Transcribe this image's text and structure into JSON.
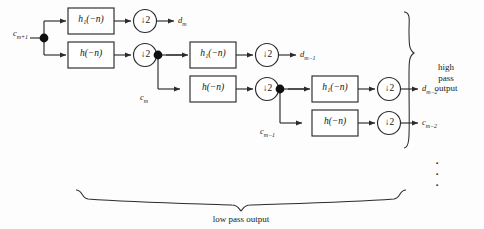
{
  "diagram": {
    "input": {
      "label": "c",
      "sub": "m+1"
    },
    "stages": [
      {
        "id": "stage-1",
        "highpass_filter": {
          "label": "h",
          "sub": "1",
          "arg": "(−n)"
        },
        "lowpass_filter": {
          "label": "h",
          "sub": "",
          "arg": "(−n)"
        },
        "downsampler": "↓2",
        "detail_output": {
          "label": "d",
          "sub": "m"
        },
        "approx_output": {
          "label": "c",
          "sub": "m"
        }
      },
      {
        "id": "stage-2",
        "highpass_filter": {
          "label": "h",
          "sub": "1",
          "arg": "(−n)"
        },
        "lowpass_filter": {
          "label": "h",
          "sub": "",
          "arg": "(−n)"
        },
        "downsampler": "↓2",
        "detail_output": {
          "label": "d",
          "sub": "m−1"
        },
        "approx_output": {
          "label": "c",
          "sub": "m−1"
        }
      },
      {
        "id": "stage-3",
        "highpass_filter": {
          "label": "h",
          "sub": "1",
          "arg": "(−n)"
        },
        "lowpass_filter": {
          "label": "h",
          "sub": "",
          "arg": "(−n)"
        },
        "downsampler": "↓2",
        "detail_output": {
          "label": "d",
          "sub": "m−2"
        },
        "approx_output": {
          "label": "c",
          "sub": "m−2"
        }
      }
    ],
    "filter_labels": {
      "highpass_1": "h₁(−n)",
      "lowpass": "h(−n)",
      "downsample_by_2": "↓2"
    },
    "annotations": {
      "right_brace_text": [
        "high",
        "pass",
        "output"
      ],
      "bottom_brace_text": "low pass output",
      "continuation": "⋮"
    },
    "colors": {
      "stroke": "#2b2b2b",
      "node_fill": "#101010",
      "background": "#fdfdfd",
      "text": "#1a1a1a"
    }
  }
}
